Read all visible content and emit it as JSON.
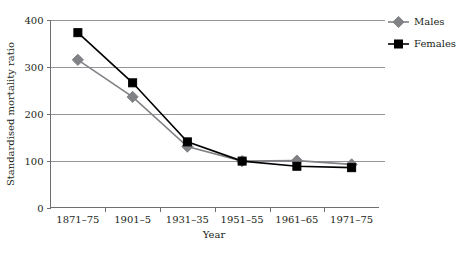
{
  "chart_data": {
    "type": "line",
    "title": "",
    "xlabel": "Year",
    "ylabel": "Standardised mortality ratio",
    "categories": [
      "1871–75",
      "1901–5",
      "1931–35",
      "1951–55",
      "1961–65",
      "1971–75"
    ],
    "ylim": [
      0,
      400
    ],
    "yticks": [
      0,
      100,
      200,
      300,
      400
    ],
    "ytick_labels": [
      "0",
      "100",
      "200",
      "300",
      "400"
    ],
    "grid": "horizontal",
    "legend_position": "right-top",
    "series": [
      {
        "name": "Males",
        "color": "#808285",
        "marker": "diamond",
        "values": [
          315,
          236,
          130,
          99,
          100,
          92
        ]
      },
      {
        "name": "Females",
        "color": "#000000",
        "marker": "square",
        "values": [
          373,
          266,
          140,
          99,
          88,
          85
        ]
      }
    ]
  },
  "legend": {
    "items": [
      {
        "label": "Males",
        "color": "#808285",
        "marker": "diamond"
      },
      {
        "label": "Females",
        "color": "#000000",
        "marker": "square"
      }
    ]
  },
  "axes": {
    "y_title": "Standardised mortality ratio",
    "x_title": "Year"
  }
}
